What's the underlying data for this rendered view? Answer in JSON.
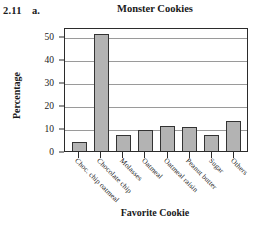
{
  "problem": {
    "number": "2.11",
    "part": "a."
  },
  "chart_data": {
    "type": "bar",
    "title": "Monster Cookies",
    "xlabel": "Favorite Cookie",
    "ylabel": "Percentage",
    "categories": [
      "Choc. chip oatmeal",
      "Chocolate chip",
      "Molasses",
      "Oatmeal",
      "Oatmeal raisin",
      "Peanut butter",
      "Sugar",
      "Others"
    ],
    "values": [
      4,
      51,
      7,
      9,
      11,
      10.5,
      7,
      13
    ],
    "ylim": [
      0,
      54
    ],
    "yticks": [
      0,
      10,
      20,
      30,
      40,
      50
    ],
    "ytick_labels": [
      "0",
      "10",
      "20",
      "30",
      "40",
      "50"
    ],
    "grid": true,
    "legend": false,
    "bar_color": "#b3b3b3",
    "bar_edge_color": "#333333",
    "axis_color": "#2b2b2b",
    "grid_color": "#9a9a9a"
  }
}
